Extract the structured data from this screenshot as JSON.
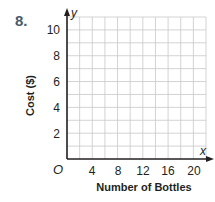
{
  "problem": {
    "number": "8."
  },
  "chart_data": {
    "type": "line",
    "title": "",
    "xlabel": "Number of Bottles",
    "ylabel": "Cost ($)",
    "x_axis_name": "x",
    "y_axis_name": "y",
    "origin_label": "O",
    "xlim": [
      0,
      22
    ],
    "ylim": [
      0,
      11
    ],
    "x_ticks": [
      "4",
      "8",
      "12",
      "16",
      "20"
    ],
    "y_ticks": [
      "2",
      "4",
      "6",
      "8",
      "10"
    ],
    "x_grid_step": 2,
    "y_grid_step": 1,
    "grid": true,
    "series": []
  }
}
